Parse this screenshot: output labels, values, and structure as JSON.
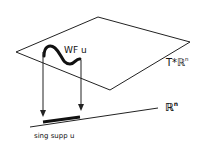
{
  "diagram": {
    "labels": {
      "wavefront": "WF u",
      "cotangent_base": "T*ℝ",
      "cotangent_sup": "n",
      "base_space": "ℝ",
      "base_sup": "n",
      "singular_support": "sing supp u"
    },
    "colors": {
      "stroke": "#111111",
      "background": "#ffffff"
    }
  }
}
